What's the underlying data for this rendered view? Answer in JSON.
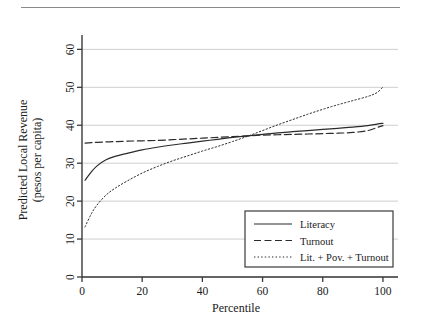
{
  "figure": {
    "name": "predicted-local-revenue-by-percentile",
    "has_top_rule": true
  },
  "chart_data": {
    "type": "line",
    "title": "",
    "xlabel": "Percentile",
    "ylabel": "Predicted Local Revenue\n(pesos per capita)",
    "ylabel_line1": "Predicted Local Revenue",
    "ylabel_line2": "(pesos per capita)",
    "xlim": [
      0,
      105
    ],
    "ylim": [
      0,
      63
    ],
    "xticks": [
      0,
      20,
      40,
      60,
      80,
      100
    ],
    "xtick_labels": [
      "0",
      "20",
      "40",
      "60",
      "80",
      "100"
    ],
    "yticks": [
      0,
      10,
      20,
      30,
      40,
      50,
      60
    ],
    "ytick_labels": [
      "0",
      "10",
      "20",
      "30",
      "40",
      "50",
      "60"
    ],
    "grid": "horizontal",
    "grid_color": "#c9c9c9",
    "axis_color": "#3a3a3a",
    "legend_position": "lower-right",
    "x": [
      1,
      3,
      5,
      8,
      11,
      15,
      20,
      25,
      30,
      35,
      40,
      45,
      50,
      55,
      60,
      65,
      70,
      75,
      80,
      85,
      90,
      95,
      98,
      100
    ],
    "series": [
      {
        "name": "Literacy",
        "style": "solid",
        "color": "#2b2b2b",
        "values": [
          25.5,
          27.6,
          29.3,
          30.9,
          31.8,
          32.6,
          33.5,
          34.2,
          34.8,
          35.3,
          35.8,
          36.3,
          36.8,
          37.2,
          37.6,
          38.0,
          38.3,
          38.6,
          38.9,
          39.2,
          39.5,
          39.9,
          40.3,
          40.5
        ]
      },
      {
        "name": "Turnout",
        "style": "dashed",
        "color": "#2b2b2b",
        "values": [
          35.3,
          35.4,
          35.5,
          35.6,
          35.7,
          35.8,
          35.9,
          36.0,
          36.2,
          36.4,
          36.6,
          36.8,
          37.0,
          37.2,
          37.4,
          37.5,
          37.6,
          37.7,
          37.8,
          37.9,
          38.1,
          38.6,
          39.4,
          39.9
        ]
      },
      {
        "name": "Lit. + Pov. + Turnout",
        "style": "dotted",
        "color": "#2b2b2b",
        "values": [
          13.2,
          16.5,
          19.0,
          21.6,
          23.4,
          25.3,
          27.4,
          29.1,
          30.6,
          31.9,
          33.2,
          34.4,
          35.7,
          37.1,
          38.6,
          40.1,
          41.5,
          42.9,
          44.2,
          45.4,
          46.5,
          47.6,
          48.6,
          50.1
        ]
      }
    ]
  },
  "legend": {
    "items": [
      {
        "label": "Literacy",
        "style": "solid"
      },
      {
        "label": "Turnout",
        "style": "dashed"
      },
      {
        "label": "Lit. + Pov. + Turnout",
        "style": "dotted"
      }
    ]
  }
}
